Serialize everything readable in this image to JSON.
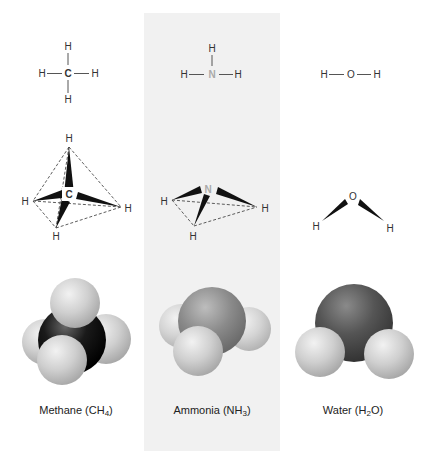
{
  "figure": {
    "columns": [
      {
        "id": "methane",
        "name": "Methane",
        "formula_main": "CH",
        "formula_sub": "4",
        "label_prefix": "Methane (",
        "label_suffix": ")",
        "central_atom": "C",
        "structural": {
          "center": "C",
          "top": "H",
          "left": "H",
          "right": "H",
          "bottom": "H"
        },
        "wedge_model": {
          "center": "C",
          "top": "H",
          "left": "H",
          "right": "H",
          "bottom": "H"
        },
        "space_fill": {
          "central_color": "#1a1a1a",
          "hydrogen_color": "#cfcfcf"
        }
      },
      {
        "id": "ammonia",
        "name": "Ammonia",
        "formula_main": "NH",
        "formula_sub": "3",
        "label_prefix": "Ammonia (",
        "label_suffix": ")",
        "central_atom": "N",
        "structural": {
          "center": "N",
          "top": "H",
          "left": "H",
          "right": "H"
        },
        "wedge_model": {
          "center": "N",
          "left": "H",
          "right": "H",
          "bottom": "H"
        },
        "space_fill": {
          "central_color": "#8a8a8a",
          "hydrogen_color": "#c8c8c8"
        }
      },
      {
        "id": "water",
        "name": "Water",
        "formula_pre": "H",
        "formula_sub": "2",
        "formula_post": "O",
        "label_prefix": "Water (",
        "label_suffix": ")",
        "central_atom": "O",
        "structural": {
          "left": "H",
          "center": "O",
          "right": "H"
        },
        "wedge_model": {
          "center": "O",
          "left": "H",
          "right": "H"
        },
        "space_fill": {
          "central_color": "#555555",
          "hydrogen_color": "#cccccc"
        }
      }
    ],
    "panel_color": "#f1f1f1"
  }
}
